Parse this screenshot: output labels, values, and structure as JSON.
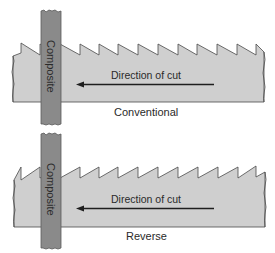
{
  "panels": [
    {
      "id": "conventional",
      "caption": "Conventional",
      "direction_label": "Direction of cut",
      "bar_label": "Composite",
      "tooth_orientation": "vertical face left, slope down to right"
    },
    {
      "id": "reverse",
      "caption": "Reverse",
      "direction_label": "Direction of cut",
      "bar_label": "Composite",
      "tooth_orientation": "slope up to right, vertical face right"
    }
  ],
  "colors": {
    "blade_fill": "#cfcfcf",
    "blade_stroke": "#4a4a4a",
    "composite_fill": "#8a8a8a",
    "composite_stroke": "#5a5a5a",
    "arrow": "#1e1e1e",
    "text": "#2a2a2a"
  }
}
